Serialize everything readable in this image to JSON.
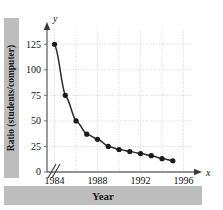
{
  "chart_data": {
    "type": "line",
    "title": "",
    "xlabel": "Year",
    "ylabel": "Ratio (students/computer)",
    "x": [
      1984,
      1985,
      1986,
      1987,
      1988,
      1989,
      1990,
      1991,
      1992,
      1993,
      1994,
      1995
    ],
    "values": [
      125,
      75,
      50,
      37,
      32,
      25,
      22,
      20,
      18,
      16,
      13,
      11
    ],
    "xlim": [
      1983.3,
      1996.6
    ],
    "ylim": [
      0,
      137
    ],
    "xticks": [
      1984,
      1988,
      1992,
      1996
    ],
    "xtick_labels": [
      "1984",
      "1988",
      "1992",
      "1996"
    ],
    "yticks": [
      0,
      25,
      50,
      75,
      100,
      125
    ],
    "ytick_labels": [
      "0",
      "25",
      "50",
      "75",
      "100",
      "125"
    ],
    "grid": true,
    "grid_style": "dotted",
    "legend": "none",
    "axis_break": true,
    "axis_arrows": true,
    "marker": "filled-circle",
    "series_color": "#1a1a1a",
    "grid_color": "#c9c9c9",
    "label_band_color": "#bdbdbd"
  },
  "axes": {
    "x_axis_name": "x",
    "y_axis_name": "y"
  }
}
